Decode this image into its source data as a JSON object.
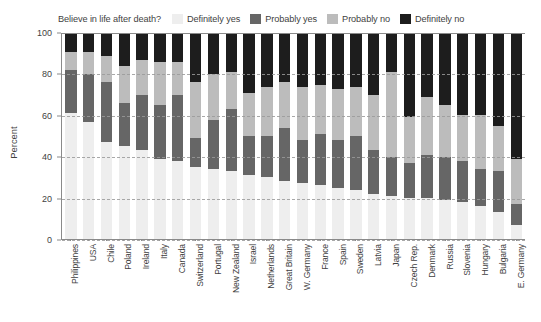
{
  "chart_data": {
    "type": "bar",
    "subtype": "stacked-bar-100",
    "title": "Believe in life after death?",
    "xlabel": "",
    "ylabel": "Percent",
    "ylim": [
      0,
      100
    ],
    "yticks": [
      0,
      20,
      40,
      60,
      80,
      100
    ],
    "grid": "horizontal-dashed",
    "legend_position": "top",
    "categories": [
      "Philippines",
      "USA",
      "Chile",
      "Poland",
      "Ireland",
      "Italy",
      "Canada",
      "Switzerland",
      "Portugal",
      "New Zealand",
      "Israel",
      "Netherlands",
      "Great Britain",
      "W. Germany",
      "France",
      "Spain",
      "Sweden",
      "Latvia",
      "Japan",
      "Czech Rep.",
      "Denmark",
      "Russia",
      "Slovenia",
      "Hungary",
      "Bulgaria",
      "E. Germany"
    ],
    "series": [
      {
        "name": "Definitely yes",
        "color": "#eeeeee",
        "values": [
          61,
          57,
          47,
          45,
          43,
          39,
          38,
          35,
          34,
          33,
          31,
          30,
          28,
          27,
          26,
          25,
          24,
          22,
          21,
          20,
          20,
          19,
          18,
          16,
          13,
          7
        ]
      },
      {
        "name": "Probably yes",
        "color": "#666666",
        "values": [
          21,
          23,
          29,
          21,
          27,
          26,
          32,
          14,
          24,
          30,
          19,
          20,
          26,
          21,
          25,
          23,
          26,
          21,
          19,
          17,
          21,
          21,
          20,
          18,
          20,
          10
        ]
      },
      {
        "name": "Probably no",
        "color": "#bcbcbc",
        "values": [
          9,
          11,
          13,
          18,
          17,
          21,
          16,
          27,
          22,
          18,
          21,
          24,
          22,
          26,
          24,
          25,
          24,
          27,
          41,
          22,
          28,
          25,
          22,
          26,
          22,
          22
        ]
      },
      {
        "name": "Definitely no",
        "color": "#1d1d1d",
        "values": [
          9,
          9,
          11,
          16,
          13,
          14,
          14,
          24,
          20,
          19,
          29,
          26,
          24,
          26,
          25,
          27,
          26,
          30,
          19,
          41,
          31,
          35,
          40,
          40,
          45,
          61
        ]
      }
    ]
  },
  "legend": {
    "question": "Believe in life after death?",
    "entries": [
      {
        "label": "Definitely yes",
        "color": "#eeeeee"
      },
      {
        "label": "Probably yes",
        "color": "#666666"
      },
      {
        "label": "Probably no",
        "color": "#bcbcbc"
      },
      {
        "label": "Definitely no",
        "color": "#1d1d1d"
      }
    ]
  },
  "axes": {
    "y": {
      "label": "Percent",
      "ticks": [
        "0",
        "20",
        "40",
        "60",
        "80",
        "100"
      ]
    }
  },
  "colors": {
    "axis": "#8a8a8a",
    "grid": "#9a9a9a",
    "text": "#3f3f3f",
    "background": "#ffffff"
  }
}
